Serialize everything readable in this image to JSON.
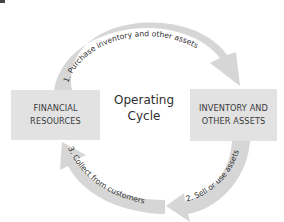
{
  "diagram": {
    "center_label": {
      "line1": "Operating",
      "line2": "Cycle"
    },
    "boxes": {
      "left": {
        "line1": "FINANCIAL",
        "line2": "RESOURCES"
      },
      "right": {
        "line1": "INVENTORY AND",
        "line2": "OTHER ASSETS"
      }
    },
    "arrows": [
      {
        "step": 1,
        "label": "1. Purchase inventory and other assets",
        "from": "FINANCIAL RESOURCES",
        "to": "INVENTORY AND OTHER ASSETS"
      },
      {
        "step": 2,
        "label": "2. Sell or use assets",
        "from": "INVENTORY AND OTHER ASSETS",
        "to": "customers"
      },
      {
        "step": 3,
        "label": "3. Collect from customers",
        "from": "customers",
        "to": "FINANCIAL RESOURCES"
      }
    ],
    "colors": {
      "box_fill": "#e2e2e2",
      "arrow_fill": "#d6d6d6",
      "text": "#2f2f2f"
    }
  }
}
